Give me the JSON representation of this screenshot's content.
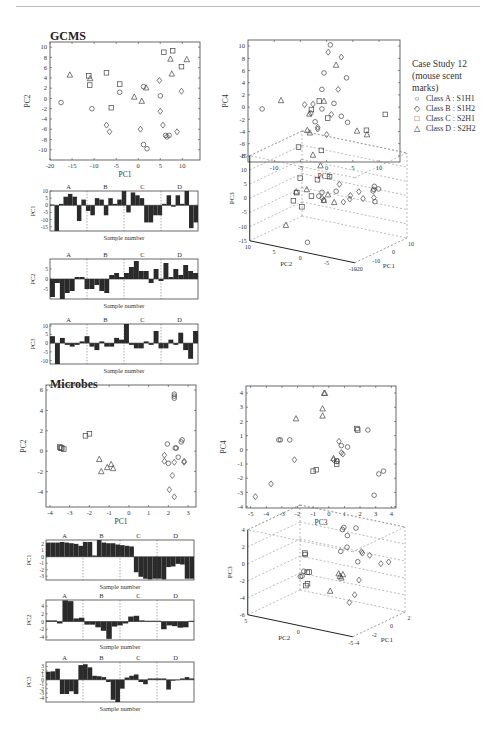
{
  "page": {
    "gcms_title": "GCMS",
    "microbes_title": "Microbes"
  },
  "legend": {
    "title_lines": [
      "Case Study 12",
      "(mouse scent",
      "marks)"
    ],
    "items": [
      {
        "marker": "circle",
        "glyph": "○",
        "label": "Class A : S1H1"
      },
      {
        "marker": "diamond",
        "glyph": "◇",
        "label": "Class B : S1H2"
      },
      {
        "marker": "square",
        "glyph": "□",
        "label": "Class C : S2H1"
      },
      {
        "marker": "triangle",
        "glyph": "△",
        "label": "Class D : S2H2"
      }
    ]
  },
  "chart_data": [
    {
      "id": "gcms_pc1_pc2",
      "type": "scatter",
      "section": "GCMS",
      "xlabel": "PC1",
      "ylabel": "PC2",
      "xlim": [
        -20,
        14
      ],
      "ylim": [
        -12,
        11
      ],
      "xticks": [
        -20,
        -15,
        -10,
        -5,
        0,
        5,
        10
      ],
      "yticks": [
        -10,
        -8,
        -6,
        -4,
        -2,
        0,
        2,
        4,
        6,
        8,
        10
      ],
      "series": [
        {
          "name": "Class A : S1H1",
          "marker": "circle",
          "points": [
            [
              -17.5,
              -0.8
            ],
            [
              -10.5,
              -2
            ],
            [
              -4.2,
              1.2
            ],
            [
              1.2,
              2.3
            ],
            [
              5,
              0.5
            ],
            [
              6.5,
              -7.5
            ],
            [
              6.2,
              -7.2
            ],
            [
              7,
              -7.2
            ],
            [
              1.2,
              -9
            ],
            [
              2,
              -9.8
            ]
          ]
        },
        {
          "name": "Class B : S1H2",
          "marker": "diamond",
          "points": [
            [
              -7.2,
              -5.2
            ],
            [
              -6.5,
              -6.5
            ],
            [
              0.5,
              -6
            ],
            [
              4.8,
              3.5
            ],
            [
              5,
              -2.5
            ],
            [
              5.6,
              -5.2
            ],
            [
              8.8,
              -6.5
            ],
            [
              9.8,
              1.4
            ]
          ]
        },
        {
          "name": "Class C : S2H1",
          "marker": "square",
          "points": [
            [
              -11.2,
              4.4
            ],
            [
              -11,
              2.6
            ],
            [
              -7.2,
              5
            ],
            [
              -4.2,
              2.8
            ],
            [
              -6.1,
              -1.8
            ],
            [
              5.8,
              9
            ],
            [
              7.8,
              9.3
            ],
            [
              9.8,
              6.2
            ]
          ]
        },
        {
          "name": "Class D : S2H2",
          "marker": "triangle",
          "points": [
            [
              -15.5,
              4.6
            ],
            [
              -10.9,
              3.9
            ],
            [
              -0.9,
              0.3
            ],
            [
              0.8,
              -0.5
            ],
            [
              1.8,
              2.1
            ],
            [
              7.3,
              7.7
            ],
            [
              7.6,
              4.8
            ],
            [
              11,
              7.6
            ]
          ]
        }
      ]
    },
    {
      "id": "gcms_pc3_pc4",
      "type": "scatter",
      "section": "GCMS",
      "xlabel": "PC3",
      "ylabel": "PC4",
      "xlim": [
        -15,
        14
      ],
      "ylim": [
        -9,
        11
      ],
      "xticks": [
        -10,
        -5,
        0,
        5,
        10
      ],
      "yticks": [
        -8,
        -6,
        -4,
        -2,
        0,
        2,
        4,
        6,
        8,
        10
      ],
      "series": [
        {
          "name": "Class A : S1H1",
          "marker": "circle",
          "points": [
            [
              -12.3,
              -0.3
            ],
            [
              0.7,
              10.2
            ],
            [
              -0.5,
              5.6
            ],
            [
              -0.9,
              2.9
            ],
            [
              -0.9,
              -0.3
            ],
            [
              -2.2,
              -2.4
            ],
            [
              1.4,
              0.6
            ],
            [
              2.8,
              -1.5
            ],
            [
              3.8,
              4.8
            ],
            [
              4,
              -2.5
            ]
          ]
        },
        {
          "name": "Class B : S1H2",
          "marker": "diamond",
          "points": [
            [
              0.3,
              9
            ],
            [
              2.8,
              8.2
            ],
            [
              2.2,
              2.9
            ],
            [
              -4.2,
              0.4
            ],
            [
              -2.6,
              0.5
            ],
            [
              -1.7,
              -3.3
            ],
            [
              -1.7,
              -3.6
            ],
            [
              0,
              -4.5
            ],
            [
              0.9,
              -1.2
            ],
            [
              -3,
              -1
            ]
          ]
        },
        {
          "name": "Class C : S2H1",
          "marker": "square",
          "points": [
            [
              -1.4,
              1
            ],
            [
              -2.9,
              -0.4
            ],
            [
              0.2,
              -1.8
            ],
            [
              -1,
              -7.1
            ],
            [
              7.6,
              -3.8
            ],
            [
              11.2,
              -1.2
            ]
          ]
        },
        {
          "name": "Class D : S2H2",
          "marker": "triangle",
          "points": [
            [
              -8.7,
              1.1
            ],
            [
              1.8,
              6.9
            ],
            [
              -0.5,
              1
            ],
            [
              -3.3,
              -1.1
            ],
            [
              -3.7,
              -3.8
            ],
            [
              -3.2,
              -4.2
            ],
            [
              5.8,
              -3.9
            ],
            [
              7.7,
              -4.5
            ]
          ]
        }
      ]
    },
    {
      "id": "gcms_bar_pc1",
      "type": "bar",
      "section": "GCMS",
      "xlabel": "Sample number",
      "ylabel": "PC1",
      "ylim": [
        -18,
        10
      ],
      "yticks": [
        -15,
        -10,
        -5,
        0,
        5,
        10
      ],
      "groups": [
        "A",
        "B",
        "C",
        "D"
      ],
      "values": [
        0.5,
        -18,
        1,
        6,
        8,
        6,
        -11,
        4,
        -4,
        -7,
        5,
        4,
        -7,
        5,
        1,
        4,
        10,
        -5,
        9,
        7,
        5,
        -12,
        -12,
        -7,
        -7,
        1,
        7,
        -1,
        7,
        1,
        10,
        -16,
        -12
      ]
    },
    {
      "id": "gcms_bar_pc2",
      "type": "bar",
      "section": "GCMS",
      "xlabel": "Sample number",
      "ylabel": "PC2",
      "ylim": [
        -10,
        10
      ],
      "yticks": [
        -5,
        0,
        5
      ],
      "groups": [
        "A",
        "B",
        "C",
        "D"
      ],
      "values": [
        -9,
        -2,
        -10,
        -7,
        -6,
        1,
        1,
        -5,
        -5,
        -3,
        -6,
        -7,
        2,
        3,
        1,
        3,
        6,
        9,
        4,
        4,
        -2,
        5,
        -1,
        8,
        1,
        5,
        2,
        7,
        4,
        3
      ]
    },
    {
      "id": "gcms_bar_pc3",
      "type": "bar",
      "section": "GCMS",
      "xlabel": "Sample number",
      "ylabel": "PC3",
      "ylim": [
        -12,
        11
      ],
      "yticks": [
        -10,
        -5,
        0,
        5,
        10
      ],
      "groups": [
        "A",
        "B",
        "C",
        "D"
      ],
      "values": [
        4,
        -12,
        3,
        -1,
        -2,
        -1,
        1,
        4,
        -2,
        -4,
        1,
        -2,
        -2,
        3,
        2,
        11,
        -1,
        -3,
        -3,
        1,
        -1,
        7,
        -3,
        -3,
        2,
        -1,
        6,
        -4,
        -9,
        7
      ]
    },
    {
      "id": "gcms_3d",
      "type": "scatter",
      "section": "GCMS",
      "xlabel": "PC1",
      "ylabel": "PC2",
      "zlabel": "PC3",
      "xticks": [
        -20,
        -10,
        0,
        10
      ],
      "yticks": [
        -10,
        -5,
        0,
        5,
        10
      ],
      "zticks": [
        -15,
        -10,
        -5,
        0,
        5,
        10,
        15
      ],
      "projection": "3d"
    },
    {
      "id": "microbes_pc1_pc2",
      "type": "scatter",
      "section": "Microbes",
      "xlabel": "PC1",
      "ylabel": "PC2",
      "xlim": [
        -4.2,
        3.4
      ],
      "ylim": [
        -5.5,
        6.5
      ],
      "xticks": [
        -4,
        -3,
        -2,
        -1,
        0,
        1,
        2,
        3
      ],
      "yticks": [
        -4,
        -2,
        0,
        2,
        4,
        6
      ],
      "series": [
        {
          "name": "Class A : S1H1",
          "marker": "circle",
          "points": [
            [
              2.3,
              5.6
            ],
            [
              2.3,
              5.4
            ],
            [
              2.3,
              5.2
            ],
            [
              1.95,
              0.7
            ],
            [
              2.35,
              0.3
            ],
            [
              2.4,
              0.3
            ],
            [
              2.5,
              -0.6
            ],
            [
              2.65,
              0.9
            ],
            [
              2.7,
              1.1
            ],
            [
              2,
              -1.2
            ]
          ]
        },
        {
          "name": "Class B : S1H2",
          "marker": "diamond",
          "points": [
            [
              1.8,
              -0.4
            ],
            [
              1.8,
              -1
            ],
            [
              2.3,
              -1.1
            ],
            [
              2.8,
              -1.1
            ],
            [
              2.8,
              -1
            ],
            [
              2.2,
              -2.4
            ],
            [
              2.05,
              -3.8
            ],
            [
              2.3,
              -4.5
            ]
          ]
        },
        {
          "name": "Class C : S2H1",
          "marker": "square",
          "points": [
            [
              -3.5,
              0.4
            ],
            [
              -3.4,
              0.3
            ],
            [
              -3.3,
              0.2
            ],
            [
              -3.45,
              0.3
            ],
            [
              -2.2,
              1.5
            ],
            [
              -2,
              1.7
            ]
          ]
        },
        {
          "name": "Class D : S2H2",
          "marker": "triangle",
          "points": [
            [
              -1.5,
              -0.8
            ],
            [
              -1.4,
              -2
            ],
            [
              -1.1,
              -1.6
            ],
            [
              -0.9,
              -1.3
            ],
            [
              -0.8,
              -1.7
            ]
          ]
        }
      ]
    },
    {
      "id": "microbes_pc3_pc4",
      "type": "scatter",
      "section": "Microbes",
      "xlabel": "PC3",
      "ylabel": "PC4",
      "xlim": [
        -5.3,
        4.3
      ],
      "ylim": [
        -4.1,
        4.5
      ],
      "xticks": [
        -5,
        -4,
        -3,
        -2,
        -1,
        0,
        1,
        2,
        3,
        4
      ],
      "yticks": [
        -4,
        -3,
        -2,
        -1,
        0,
        1,
        2,
        3,
        4
      ],
      "series": [
        {
          "name": "Class A : S1H1",
          "marker": "circle",
          "points": [
            [
              -3.2,
              0.7
            ],
            [
              -3.1,
              0.7
            ],
            [
              -2.5,
              0.7
            ],
            [
              0.8,
              0.3
            ],
            [
              1.2,
              0.2
            ],
            [
              2.5,
              1.4
            ],
            [
              3.5,
              -1.5
            ],
            [
              3.2,
              -1.7
            ],
            [
              2.9,
              -3.2
            ]
          ]
        },
        {
          "name": "Class B : S1H2",
          "marker": "diamond",
          "points": [
            [
              -4.7,
              -3.3
            ],
            [
              -3.7,
              -2.4
            ],
            [
              -2.2,
              -0.7
            ],
            [
              0.65,
              0.6
            ],
            [
              0.8,
              -0.2
            ],
            [
              0.9,
              -0.3
            ],
            [
              0.3,
              -0.7
            ],
            [
              0.55,
              -0.8
            ]
          ]
        },
        {
          "name": "Class C : S2H1",
          "marker": "square",
          "points": [
            [
              -1,
              -1.5
            ],
            [
              -0.8,
              -1.4
            ],
            [
              0.5,
              -1
            ],
            [
              0.5,
              -0.8
            ],
            [
              1.8,
              1.5
            ],
            [
              1.85,
              1.4
            ]
          ]
        },
        {
          "name": "Class D : S2H2",
          "marker": "triangle",
          "points": [
            [
              -2.1,
              2.2
            ],
            [
              -0.4,
              2.4
            ],
            [
              -0.4,
              2.9
            ],
            [
              -0.25,
              4
            ],
            [
              -0.3,
              4
            ],
            [
              0.3,
              -0.6
            ]
          ]
        }
      ]
    },
    {
      "id": "microbes_bar_pc1",
      "type": "bar",
      "section": "Microbes",
      "xlabel": "Sample number",
      "ylabel": "PC1",
      "ylim": [
        -3.6,
        2.6
      ],
      "yticks": [
        -3,
        -2,
        -1,
        0,
        1,
        2
      ],
      "groups": [
        "A",
        "B",
        "C",
        "D"
      ],
      "values": [
        2.2,
        2.2,
        2.2,
        2.3,
        2.2,
        2.1,
        2.0,
        1.7,
        2.3,
        2.3,
        0.2,
        2.6,
        2.2,
        2.1,
        2.1,
        1.9,
        1.8,
        1.7,
        1.6,
        -2.4,
        -3.1,
        -3.4,
        -3.5,
        -3.4,
        -3.4,
        -3.5,
        -1.6,
        -1.5,
        -1.1,
        -1.2,
        -3.4,
        -3.4
      ]
    },
    {
      "id": "microbes_bar_pc2",
      "type": "bar",
      "section": "Microbes",
      "xlabel": "Sample number",
      "ylabel": "PC2",
      "ylim": [
        -4.8,
        5.6
      ],
      "yticks": [
        -4,
        -2,
        0,
        2,
        4
      ],
      "groups": [
        "A",
        "B",
        "C",
        "D"
      ],
      "values": [
        0.3,
        0.3,
        -0.5,
        5.5,
        5.3,
        0.8,
        1,
        -0.8,
        -0.8,
        -1.5,
        -2.4,
        -4.5,
        -1.3,
        -1,
        -0.5,
        1.3,
        1.5,
        0.3,
        0.2,
        0.2,
        0.2,
        -2,
        -1,
        -1.2,
        -1.6,
        -1.5,
        0.2
      ]
    },
    {
      "id": "microbes_bar_pc3",
      "type": "bar",
      "section": "Microbes",
      "xlabel": "Sample number",
      "ylabel": "PC3",
      "ylim": [
        -5,
        4
      ],
      "yticks": [
        -4,
        -3,
        -2,
        -1,
        0,
        1,
        2,
        3
      ],
      "groups": [
        "A",
        "B",
        "C",
        "D"
      ],
      "values": [
        1.8,
        1.9,
        2.5,
        -3.2,
        -3.2,
        -2.6,
        -3.2,
        3.3,
        3.5,
        2.8,
        0.9,
        0.8,
        0.6,
        -0.5,
        -4.5,
        -5,
        -2,
        0.5,
        0.9,
        1.2,
        -0.5,
        -1,
        0.3,
        0.3,
        0.3,
        0.3,
        -2.2,
        -0.2,
        -0.1,
        0.3,
        0.6,
        0.3
      ]
    },
    {
      "id": "microbes_3d",
      "type": "scatter",
      "section": "Microbes",
      "xlabel": "PC1",
      "ylabel": "PC2",
      "zlabel": "PC3",
      "xticks": [
        -4,
        -2,
        0,
        2
      ],
      "yticks": [
        -5,
        0,
        5
      ],
      "zticks": [
        -6,
        -4,
        -2,
        0,
        2,
        4
      ],
      "projection": "3d"
    }
  ]
}
